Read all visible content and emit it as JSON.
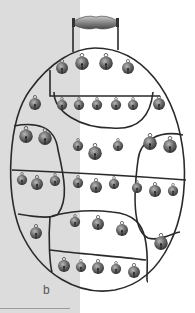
{
  "figure": {
    "panel_label": "b",
    "colors": {
      "left_background": "#dcdcdc",
      "right_background": "#ffffff",
      "frame": "#2a2a2a",
      "bell": "#6e6e6e",
      "handle": "#8a8a8a"
    }
  }
}
